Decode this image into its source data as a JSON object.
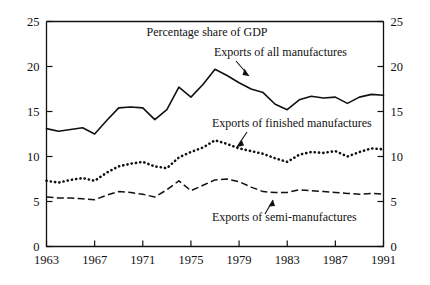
{
  "chart_data": {
    "type": "line",
    "title": "Percentage share of GDP",
    "xlabel": "",
    "ylabel": "",
    "xlim": [
      1963,
      1991
    ],
    "ylim": [
      0,
      25
    ],
    "yticks": [
      0,
      5,
      10,
      15,
      20,
      25
    ],
    "ytick_labels": [
      "0",
      "5",
      "10",
      "15",
      "20",
      "25"
    ],
    "xticks": [
      1963,
      1967,
      1971,
      1975,
      1979,
      1983,
      1987,
      1991
    ],
    "xtick_labels": [
      "1963",
      "1967",
      "1971",
      "1975",
      "1979",
      "1983",
      "1987",
      "1991"
    ],
    "right_axis_ticks": [
      0,
      5,
      10,
      15,
      20,
      25
    ],
    "right_axis_tick_labels": [
      "0",
      "5",
      "10",
      "15",
      "20",
      "25"
    ],
    "grid": false,
    "legend_position": "inline-annotations",
    "x": [
      1963,
      1964,
      1965,
      1966,
      1967,
      1968,
      1969,
      1970,
      1971,
      1972,
      1973,
      1974,
      1975,
      1976,
      1977,
      1978,
      1979,
      1980,
      1981,
      1982,
      1983,
      1984,
      1985,
      1986,
      1987,
      1988,
      1989,
      1990,
      1991
    ],
    "series": [
      {
        "name": "Exports of all manufactures",
        "style": "solid",
        "values": [
          13.1,
          12.8,
          13.0,
          13.2,
          12.5,
          14.0,
          15.4,
          15.5,
          15.4,
          14.1,
          15.2,
          17.7,
          16.6,
          18.0,
          19.7,
          19.0,
          18.2,
          17.5,
          17.1,
          15.8,
          15.2,
          16.3,
          16.7,
          16.5,
          16.6,
          15.9,
          16.6,
          16.9,
          16.8
        ]
      },
      {
        "name": "Exports of finished manufactures",
        "style": "dotted",
        "values": [
          7.3,
          7.1,
          7.4,
          7.6,
          7.3,
          8.2,
          8.9,
          9.2,
          9.4,
          8.9,
          8.7,
          9.9,
          10.5,
          11.0,
          11.8,
          11.4,
          10.9,
          10.6,
          10.3,
          9.8,
          9.4,
          10.2,
          10.5,
          10.4,
          10.6,
          10.0,
          10.5,
          10.9,
          10.8
        ]
      },
      {
        "name": "Exports of semi-manufactures",
        "style": "dashed",
        "values": [
          5.5,
          5.4,
          5.4,
          5.3,
          5.2,
          5.7,
          6.1,
          6.0,
          5.8,
          5.5,
          6.3,
          7.3,
          6.2,
          6.8,
          7.4,
          7.5,
          7.2,
          6.6,
          6.1,
          6.0,
          6.0,
          6.3,
          6.2,
          6.1,
          6.0,
          5.9,
          5.8,
          5.9,
          5.8
        ]
      }
    ],
    "annotations": [
      {
        "text": "Exports of all manufactures",
        "series": "Exports of all manufactures"
      },
      {
        "text": "Exports of finished manufactures",
        "series": "Exports of finished manufactures"
      },
      {
        "text": "Exports of semi-manufactures",
        "series": "Exports of semi-manufactures"
      }
    ]
  },
  "colors": {
    "ink": "#111111",
    "background": "#ffffff"
  }
}
